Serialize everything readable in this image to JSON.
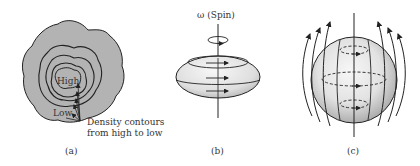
{
  "panels": [
    {
      "id": "a",
      "caption": "(a)",
      "labels": {
        "high": "High",
        "low": "Low",
        "annotation_line1": "Density contours",
        "annotation_line2": "from high to low"
      }
    },
    {
      "id": "b",
      "caption": "(b)",
      "labels": {
        "spin": "ω (Spin)"
      }
    },
    {
      "id": "c",
      "caption": "(c)"
    }
  ],
  "colors": {
    "cloud_fill": "#b3b3b3",
    "line": "#222222",
    "sphere_light": "#f2f2f2",
    "sphere_dark": "#bdbdbd"
  }
}
